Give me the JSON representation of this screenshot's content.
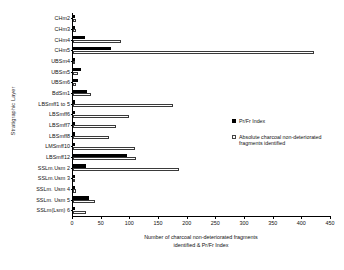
{
  "chart_data": {
    "type": "bar",
    "orientation": "horizontal",
    "title": "",
    "xlabel": "Number of charcoal non-deteriorated fragments identified & Pr/Fr Index",
    "ylabel": "Stratigraphic Layer",
    "xlim": [
      0,
      450
    ],
    "xticks": [
      0,
      50,
      100,
      150,
      200,
      250,
      300,
      350,
      400,
      450
    ],
    "grid": false,
    "legend_position": "right",
    "categories": [
      "CHm2",
      "CHm3",
      "CHm4",
      "CHm5",
      "UBSm4",
      "UBSm5",
      "UBSm6",
      "BdSm1",
      "LBSmff1 to 5",
      "LBSmff6",
      "LBSmff7",
      "LBSmff8",
      "LMSmff10",
      "LBSmff12",
      "SSLm.Usm 2",
      "SSLm.Usm 3",
      "SSLm. Usm 4",
      "SSLm. Usm 5",
      "SSLm(Lsm) 6"
    ],
    "series": [
      {
        "name": "Pr/Fr Index",
        "style": "solid-black",
        "values": [
          4,
          4,
          21,
          66,
          0,
          14,
          9,
          24,
          3,
          4,
          3,
          2,
          2,
          95,
          22,
          3,
          3,
          28,
          1
        ]
      },
      {
        "name": "Absolute charcoal non-deteriorated fragments identified",
        "style": "open-white",
        "values": [
          5,
          6,
          84,
          420,
          0,
          9,
          6,
          31,
          175,
          98,
          75,
          62,
          108,
          110,
          185,
          4,
          5,
          38,
          22
        ]
      }
    ]
  },
  "legend": {
    "entries": [
      {
        "label": "Pr/Fr Index",
        "marker": "filled-square"
      },
      {
        "label": "Absolute charcoal non-deteriorated fragments identified",
        "marker": "open-square"
      }
    ]
  },
  "axis_title_lines": {
    "line1": "Number of charcoal non-deteriorated fragments",
    "line2": "identified & Pr/Fr Index"
  }
}
